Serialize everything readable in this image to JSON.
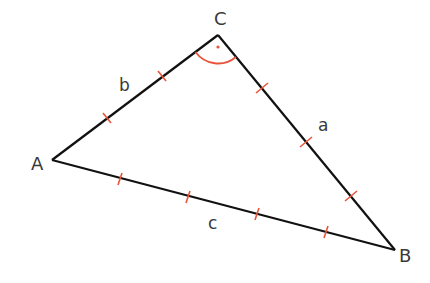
{
  "diagram": {
    "type": "triangle",
    "vertices": {
      "A": {
        "label": "A",
        "x": 52,
        "y": 160
      },
      "B": {
        "label": "B",
        "x": 395,
        "y": 250
      },
      "C": {
        "label": "C",
        "x": 218,
        "y": 35
      }
    },
    "sides": {
      "a": {
        "label": "a",
        "from": "C",
        "to": "B",
        "tick_marks": 3
      },
      "b": {
        "label": "b",
        "from": "A",
        "to": "C",
        "tick_marks": 2
      },
      "c": {
        "label": "c",
        "from": "A",
        "to": "B",
        "tick_marks": 4
      }
    },
    "right_angle_at": "C",
    "colors": {
      "line": "#111111",
      "marks": "#e8553a",
      "text": "#3a3a3a"
    }
  }
}
